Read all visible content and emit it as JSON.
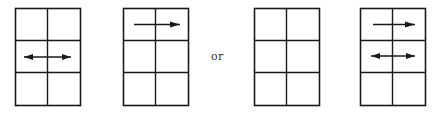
{
  "diagram": {
    "grids": [
      {
        "id": "grid-1",
        "rows": 3,
        "cols": 2,
        "arrows": [
          {
            "row": 2,
            "type": "double-headed",
            "direction": "left-right"
          }
        ]
      },
      {
        "id": "grid-2",
        "rows": 3,
        "cols": 2,
        "arrows": [
          {
            "row": 1,
            "type": "single-headed",
            "direction": "right"
          }
        ]
      },
      {
        "id": "grid-3",
        "rows": 3,
        "cols": 2,
        "arrows": []
      },
      {
        "id": "grid-4",
        "rows": 3,
        "cols": 2,
        "arrows": [
          {
            "row": 1,
            "type": "single-headed",
            "direction": "right"
          },
          {
            "row": 2,
            "type": "double-headed",
            "direction": "left-right"
          }
        ]
      }
    ],
    "separator_label": "or",
    "line_color": "#1a1a1a",
    "background": "#ffffff"
  }
}
